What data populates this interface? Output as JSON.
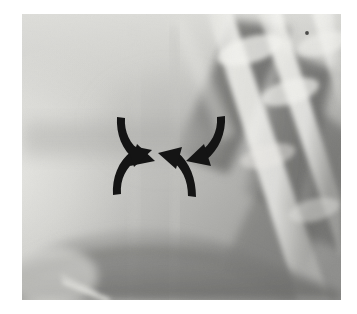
{
  "figure": {
    "type": "radiograph",
    "modality_label": "x-ray-radiograph",
    "description": "Grayscale chest radiograph detail with four converging black arrows marking a central lesion",
    "frame": {
      "x": 22,
      "y": 14,
      "width": 319,
      "height": 286
    },
    "colors": {
      "page_background": "#ffffff",
      "film_base": "#b9b9b9",
      "film_bright": "#e8e8e4",
      "film_mid": "#a8a8a6",
      "film_dark": "#6d6d6b",
      "film_darkest": "#4a4a49",
      "rib_highlight": "#f2f2ee",
      "arrow_color": "#141414"
    },
    "annotations": {
      "arrow_count": 4,
      "arrow_label": "converging-marker-arrows",
      "convergence_point": {
        "x": 168,
        "y": 152
      },
      "arrows": [
        {
          "name": "arrow-top-left",
          "direction": "down-right",
          "tail": {
            "x": 128,
            "y": 124
          },
          "tip": {
            "x": 152,
            "y": 150
          }
        },
        {
          "name": "arrow-top-right",
          "direction": "down-left",
          "tail": {
            "x": 213,
            "y": 124
          },
          "tip": {
            "x": 185,
            "y": 150
          }
        },
        {
          "name": "arrow-bottom-left",
          "direction": "up-right",
          "tail": {
            "x": 127,
            "y": 190
          },
          "tip": {
            "x": 152,
            "y": 162
          }
        },
        {
          "name": "arrow-bottom-right",
          "direction": "up-left",
          "tail": {
            "x": 193,
            "y": 190
          },
          "tip": {
            "x": 175,
            "y": 160
          }
        }
      ]
    },
    "structures": [
      {
        "name": "rib-band-1",
        "kind": "bright-diagonal-rib",
        "brightness": "high"
      },
      {
        "name": "rib-band-2",
        "kind": "bright-diagonal-rib",
        "brightness": "high"
      },
      {
        "name": "rib-band-3",
        "kind": "bright-diagonal-rib",
        "brightness": "high"
      },
      {
        "name": "rib-band-4",
        "kind": "bright-diagonal-rib",
        "brightness": "medium"
      },
      {
        "name": "intercostal-space-dark",
        "kind": "dark-lucent-band",
        "brightness": "low"
      },
      {
        "name": "soft-tissue-left",
        "kind": "homogeneous-bright-field",
        "brightness": "high"
      },
      {
        "name": "diaphragm-curve",
        "kind": "dark-curved-band",
        "brightness": "low"
      },
      {
        "name": "linear-streak",
        "kind": "bright-linear-streak",
        "brightness": "high"
      },
      {
        "name": "film-speck",
        "kind": "dark-speck-artifact",
        "brightness": "very-low"
      }
    ]
  }
}
